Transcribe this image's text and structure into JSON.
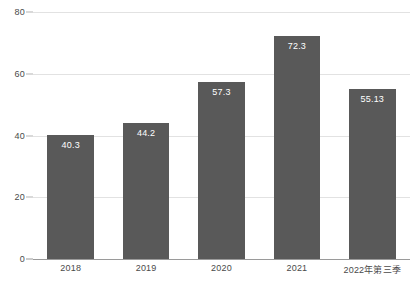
{
  "chart_data": {
    "type": "bar",
    "title": "",
    "subtitle": "",
    "xlabel": "",
    "ylabel": "",
    "categories": [
      "2018",
      "2019",
      "2020",
      "2021",
      "2022年第三季"
    ],
    "values": [
      40.3,
      44.2,
      57.3,
      72.3,
      55.13
    ],
    "value_labels": [
      "40.3",
      "44.2",
      "57.3",
      "72.3",
      "55.13"
    ],
    "ylim": [
      0,
      80
    ],
    "yticks": [
      0,
      20,
      40,
      60,
      80
    ],
    "ytick_labels": [
      "0",
      "20",
      "40",
      "60",
      "80"
    ],
    "grid": true,
    "legend": false,
    "legend_position": "none",
    "series": [
      {
        "name": "",
        "values": [
          40.3,
          44.2,
          57.3,
          72.3,
          55.13
        ]
      }
    ],
    "colors": {
      "bar": "#595959",
      "gridline": "#e2e2e2",
      "axis": "#9a9a9a",
      "value_label": "#ffffff",
      "tick_label": "#4a4a4a",
      "background": "#ffffff"
    }
  }
}
